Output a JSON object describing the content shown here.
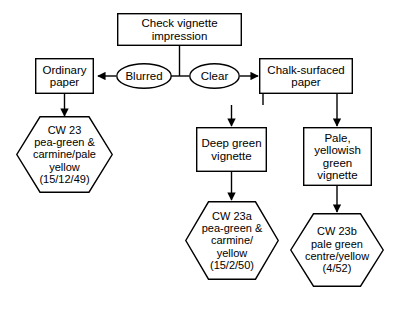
{
  "diagram": {
    "stroke_color": "#000000",
    "fill_color": "#ffffff",
    "text_color": "#000000",
    "nodes": {
      "root": {
        "shape": "box",
        "lines": "Check vignette\nimpression"
      },
      "blurred": {
        "shape": "ellipse",
        "lines": "Blurred"
      },
      "clear": {
        "shape": "ellipse",
        "lines": "Clear"
      },
      "ordinary_paper": {
        "shape": "box",
        "lines": "Ordinary\npaper"
      },
      "chalk_paper": {
        "shape": "box",
        "lines": "Chalk-surfaced\npaper"
      },
      "cw23": {
        "shape": "hexagon",
        "lines": "CW 23\npea-green &\ncarmine/pale\nyellow\n(15/12/49)"
      },
      "deep_green": {
        "shape": "box",
        "lines": "Deep green\nvignette"
      },
      "pale_yellowish": {
        "shape": "box",
        "lines": "Pale,\nyellowish\ngreen\nvignette"
      },
      "cw23a": {
        "shape": "hexagon",
        "lines": "CW 23a\npea-green &\ncarmine/\nyellow\n(15/2/50)"
      },
      "cw23b": {
        "shape": "hexagon",
        "lines": "CW 23b\npale green\ncentre/yellow\n(4/52)"
      }
    }
  }
}
